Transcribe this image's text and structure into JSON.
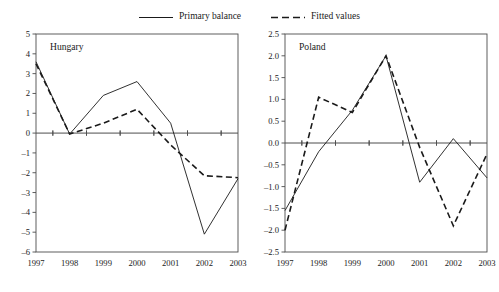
{
  "legend": {
    "position": "top-center",
    "items": [
      {
        "label": "Primary balance",
        "style": "solid",
        "swatch": "solid-line-swatch"
      },
      {
        "label": "Fitted values",
        "style": "dashed",
        "swatch": "dashed-line-swatch"
      }
    ]
  },
  "colors": {
    "line": "#1a1a1a",
    "axis": "#4d4d4d",
    "frame": "#4d4d4d",
    "background": "#ffffff"
  },
  "chart_data": [
    {
      "type": "line",
      "title": "Hungary",
      "xlabel": "",
      "ylabel": "",
      "x": [
        1997,
        1998,
        1999,
        2000,
        2001,
        2002,
        2003
      ],
      "xticklabels": [
        "1997",
        "1998",
        "1999",
        "2000",
        "2001",
        "2002",
        "2003"
      ],
      "ylim": [
        -6,
        5
      ],
      "yticks": [
        5,
        4,
        3,
        2,
        1,
        0,
        -1,
        -2,
        -3,
        -4,
        -5,
        -6
      ],
      "yticklabels": [
        "5",
        "4",
        "3",
        "2",
        "1",
        "0",
        "–1",
        "–2",
        "–3",
        "–4",
        "–5",
        "–6"
      ],
      "grid": false,
      "zeroline": true,
      "series": [
        {
          "name": "Primary balance",
          "style": "solid",
          "values": [
            3.6,
            -0.05,
            1.9,
            2.6,
            0.5,
            -5.1,
            -2.3
          ]
        },
        {
          "name": "Fitted values",
          "style": "dashed",
          "values": [
            3.5,
            -0.05,
            0.5,
            1.2,
            -0.6,
            -2.15,
            -2.25
          ]
        }
      ]
    },
    {
      "type": "line",
      "title": "Poland",
      "xlabel": "",
      "ylabel": "",
      "x": [
        1997,
        1998,
        1999,
        2000,
        2001,
        2002,
        2003
      ],
      "xticklabels": [
        "1997",
        "1998",
        "1999",
        "2000",
        "2001",
        "2002",
        "2003"
      ],
      "ylim": [
        -2.5,
        2.5
      ],
      "yticks": [
        2.5,
        2.0,
        1.5,
        1.0,
        0.5,
        0.0,
        -0.5,
        -1.0,
        -1.5,
        -2.0,
        -2.5
      ],
      "yticklabels": [
        "2.5",
        "2.0",
        "1.5",
        "1.0",
        "0.5",
        "0.0",
        "–0.5",
        "–1.0",
        "–1.5",
        "–2.0",
        "–2.5"
      ],
      "grid": false,
      "zeroline": true,
      "series": [
        {
          "name": "Primary balance",
          "style": "solid",
          "values": [
            -1.55,
            -0.2,
            0.75,
            2.0,
            -0.9,
            0.1,
            -0.8
          ]
        },
        {
          "name": "Fitted values",
          "style": "dashed",
          "values": [
            -2.0,
            1.05,
            0.7,
            2.0,
            -0.1,
            -1.9,
            -0.25
          ]
        }
      ]
    }
  ]
}
